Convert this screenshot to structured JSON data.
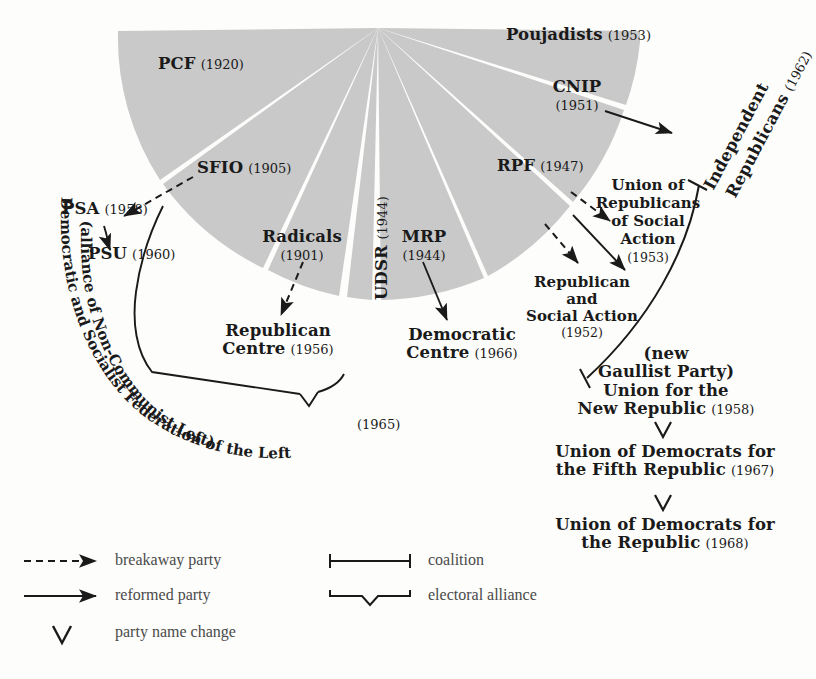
{
  "figure": {
    "type": "radial-fan-genealogy",
    "background_color": "#fdfdfb",
    "wedge_fill": "#c9c9c9",
    "wedge_gap_color": "#ffffff",
    "ink_color": "#1a1a1a",
    "legend_text_color": "#4a4a4a"
  },
  "wedges": [
    {
      "id": "pcf",
      "name": "PCF",
      "year": "(1920)"
    },
    {
      "id": "sfio",
      "name": "SFIO",
      "year": "(1905)"
    },
    {
      "id": "radicals",
      "name": "Radicals",
      "year": "(1901)"
    },
    {
      "id": "udsr",
      "name": "UDSR",
      "year": "(1944)"
    },
    {
      "id": "mrp",
      "name": "MRP",
      "year": "(1944)"
    },
    {
      "id": "rpf",
      "name": "RPF",
      "year": "(1947)"
    },
    {
      "id": "cnip",
      "name": "CNIP",
      "year": "(1951)"
    },
    {
      "id": "poujadists",
      "name": "Poujadists",
      "year": "(1953)"
    }
  ],
  "offshoots": {
    "psa": {
      "name": "PSA",
      "year": "(1958)"
    },
    "psu": {
      "name": "PSU",
      "year": "(1960)"
    },
    "republican_centre": {
      "name": "Republican\nCentre",
      "line1": "Republican",
      "line2": "Centre",
      "year": "(1956)"
    },
    "democratic_centre": {
      "name": "Democratic\nCentre",
      "line1": "Democratic",
      "line2": "Centre",
      "year": "(1966)"
    },
    "rsa": {
      "line1": "Republican",
      "line2": "and",
      "line3": "Social Action",
      "year": "(1952)"
    },
    "ursa": {
      "line1": "Union of",
      "line2": "Republicans",
      "line3": "of Social",
      "line4": "Action",
      "year": "(1953)"
    },
    "independent_republicans": {
      "line1": "Independent",
      "line2": "Republicans",
      "year": "(1962)"
    }
  },
  "gaullist_chain": [
    {
      "line1": "(new",
      "line2": "Gaullist Party)",
      "line3": "Union for the",
      "line4": "New Republic",
      "year": "(1958)"
    },
    {
      "line1": "Union of Democrats for",
      "line2": "the Fifth Republic",
      "year": "(1967)"
    },
    {
      "line1": "Union of Democrats for",
      "line2": "the Republic",
      "year": "(1968)"
    }
  ],
  "alliances": {
    "fgds": {
      "curve_text_1": "Democratic and Socialist Federation of the Left",
      "curve_text_2": "(alliance of Non-Communist Left)",
      "year": "(1965)"
    }
  },
  "legend": {
    "items": [
      {
        "icon": "dashed-arrow-icon",
        "label": "breakaway party"
      },
      {
        "icon": "solid-arrow-icon",
        "label": "reformed party"
      },
      {
        "icon": "chevron-down-icon",
        "label": "party name change"
      },
      {
        "icon": "coalition-bracket-icon",
        "label": "coalition"
      },
      {
        "icon": "electoral-alliance-brace-icon",
        "label": "electoral alliance"
      }
    ]
  }
}
